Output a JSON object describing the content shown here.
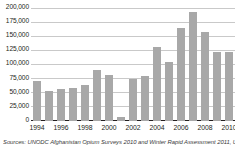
{
  "chart_data": {
    "type": "bar",
    "title": "",
    "subtitle": "",
    "xlabel": "",
    "ylabel": "",
    "categories": [
      "1994",
      "1995",
      "1996",
      "1997",
      "1998",
      "1999",
      "2000",
      "2001",
      "2002",
      "2003",
      "2004",
      "2005",
      "2006",
      "2007",
      "2008",
      "2009",
      "2010"
    ],
    "values": [
      71470,
      53760,
      56824,
      58416,
      63674,
      90583,
      82171,
      7606,
      74100,
      80000,
      131000,
      104000,
      165000,
      193000,
      157000,
      123000,
      123000
    ],
    "x_tick_labels": [
      "1994",
      "1996",
      "1998",
      "2000",
      "2002",
      "2004",
      "2006",
      "2008",
      "2010"
    ],
    "y_tick_labels": [
      "0",
      "25,000",
      "50,000",
      "75,000",
      "100,000",
      "125,000",
      "150,000",
      "175,000",
      "200,000"
    ],
    "y_tick_values": [
      0,
      25000,
      50000,
      75000,
      100000,
      125000,
      150000,
      175000,
      200000
    ],
    "ylim": [
      0,
      200000
    ],
    "grid": true,
    "legend": false,
    "bar_color": "#a8a8a8",
    "gridline_color": "#c9c9c9",
    "axis_color": "#231f20"
  },
  "source_note": "Sources: UNODC Afghanistan Opium Surveys 2010 and Winter Rapid Assessment 2011, UNO"
}
